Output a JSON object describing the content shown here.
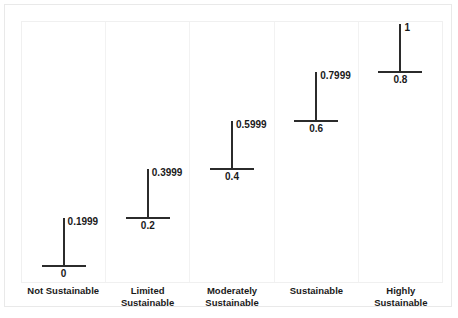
{
  "chart_data": {
    "type": "bar",
    "title": "",
    "subtitle": "",
    "xlabel": "",
    "ylabel": "",
    "ylim": [
      0,
      1
    ],
    "grid": false,
    "legend": null,
    "orientation": "vertical",
    "note": "Five panels, each showing a membership interval drawn as a vertical line rising from a horizontal tick at the lower bound up to the upper bound.",
    "categories": [
      "Not Sustainable",
      "Limited Sustainable",
      "Moderately Sustainable",
      "Sustainable",
      "Highly Sustainable"
    ],
    "category_lines": [
      [
        "Not Sustainable"
      ],
      [
        "Limited",
        "Sustainable"
      ],
      [
        "Moderately",
        "Sustainable"
      ],
      [
        "Sustainable"
      ],
      [
        "Highly",
        "Sustainable"
      ]
    ],
    "series": [
      {
        "name": "lower bound",
        "values": [
          0,
          0.2,
          0.4,
          0.6,
          0.8
        ]
      },
      {
        "name": "upper bound",
        "values": [
          0.1999,
          0.3999,
          0.5999,
          0.7999,
          1
        ]
      }
    ],
    "panels": [
      {
        "category": "Not Sustainable",
        "lower": 0,
        "upper": 0.1999,
        "lower_label": "0",
        "upper_label": "0.1999"
      },
      {
        "category": "Limited Sustainable",
        "lower": 0.2,
        "upper": 0.3999,
        "lower_label": "0.2",
        "upper_label": "0.3999"
      },
      {
        "category": "Moderately Sustainable",
        "lower": 0.4,
        "upper": 0.5999,
        "lower_label": "0.4",
        "upper_label": "0.5999"
      },
      {
        "category": "Sustainable",
        "lower": 0.6,
        "upper": 0.7999,
        "lower_label": "0.6",
        "upper_label": "0.7999"
      },
      {
        "category": "Highly Sustainable",
        "lower": 0.8,
        "upper": 1,
        "lower_label": "0.8",
        "upper_label": "1"
      }
    ]
  },
  "style": {
    "marker_color": "#2b2b2b",
    "frame_color": "#e9e9e9",
    "panel_divider_color": "#f2f2f2",
    "background": "#ffffff",
    "text_color": "#1a1a1a"
  }
}
